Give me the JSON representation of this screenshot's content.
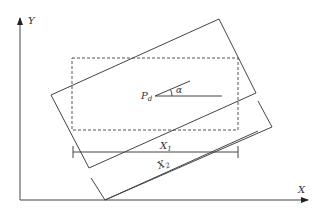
{
  "axes": {
    "x_label": "X",
    "y_label": "Y"
  },
  "point": {
    "label": "P",
    "subscript": "d"
  },
  "angle": {
    "label": "α"
  },
  "dimensions": [
    {
      "label": "X",
      "subscript": "1"
    },
    {
      "label": "X",
      "subscript": "2"
    }
  ],
  "colors": {
    "stroke": "#444444",
    "background": "#ffffff"
  }
}
